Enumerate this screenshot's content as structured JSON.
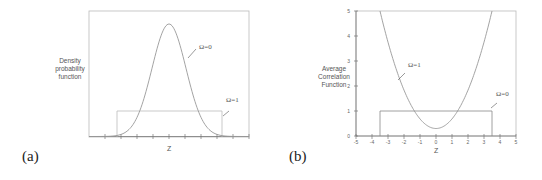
{
  "chart_data": [
    {
      "panel": "(a)",
      "type": "line",
      "title": "",
      "xlabel": "Z",
      "ylabel": "Density probability function",
      "grid": false,
      "x_ticks_count": 14,
      "x_tick_labels": [],
      "series": [
        {
          "name": "Ω=0",
          "shape": "gaussian",
          "center": 0,
          "peak_relative": 1.0,
          "description": "bell-shaped curve peaking at Z=0"
        },
        {
          "name": "Ω=1",
          "shape": "uniform",
          "level_relative": 0.2,
          "range": [
            -3.5,
            3.5
          ],
          "description": "rectangular (uniform) distribution"
        }
      ],
      "annotations": [
        "Ω=0",
        "Ω=1"
      ]
    },
    {
      "panel": "(b)",
      "type": "line",
      "title": "",
      "xlabel": "Z",
      "ylabel": "Average Correlation Function",
      "grid": false,
      "xlim": [
        -5,
        5
      ],
      "ylim": [
        0,
        5
      ],
      "x_ticks": [
        -5,
        -4,
        -3,
        -2,
        -1,
        0,
        1,
        2,
        3,
        4,
        5
      ],
      "y_ticks": [
        0,
        1,
        2,
        3,
        4,
        5
      ],
      "series": [
        {
          "name": "Ω=1",
          "shape": "parabola",
          "x": [
            -3.5,
            -3,
            -2,
            -1.8,
            -1,
            0,
            1,
            1.8,
            2,
            3,
            3.5
          ],
          "y": [
            5,
            3.9,
            1.3,
            1.0,
            0.5,
            0.3,
            0.5,
            1.0,
            1.3,
            3.9,
            5
          ]
        },
        {
          "name": "Ω=0",
          "shape": "rectangle",
          "x": [
            -3.5,
            -3.5,
            3.5,
            3.5
          ],
          "y": [
            0,
            1,
            1,
            0
          ]
        }
      ],
      "annotations": [
        "Ω=1",
        "Ω=0"
      ]
    }
  ],
  "labels": {
    "panel_a": "(a)",
    "panel_b": "(b)",
    "a_ylabel_lines": [
      "Density",
      "probability",
      "function"
    ],
    "b_ylabel_lines": [
      "Average",
      "Correlation",
      "Function"
    ],
    "a_xlabel": "Z",
    "b_xlabel": "Z",
    "a_ann_omega0": "Ω=0",
    "a_ann_omega1": "Ω=1",
    "b_ann_omega1": "Ω=1",
    "b_ann_omega0": "Ω=0",
    "b_yticks": [
      "0",
      "1",
      "2",
      "3",
      "4",
      "5"
    ],
    "b_xticks": [
      "-5",
      "-4",
      "-3",
      "-2",
      "-1",
      "0",
      "1",
      "2",
      "3",
      "4",
      "5"
    ]
  }
}
